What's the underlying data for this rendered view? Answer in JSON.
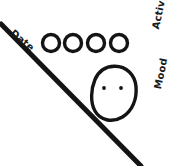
{
  "sketch": {
    "title": "Hand-drawn daily tracker sketch",
    "background_color": "#ffffff",
    "ink_color": "#141414",
    "labels": {
      "date": "Date",
      "activity": "Activity",
      "mood": "Mood"
    },
    "divider": {
      "name": "diagonal-divider-line",
      "from_x": 1,
      "from_y": 24,
      "to_x": 141,
      "to_y": 166,
      "stroke_width": 5
    },
    "activity_circles": {
      "count": 4,
      "diameter": 17,
      "stroke_width": 3.4,
      "filled": false,
      "centers": [
        {
          "cx": 51,
          "cy": 43
        },
        {
          "cx": 73,
          "cy": 43
        },
        {
          "cx": 96,
          "cy": 43
        },
        {
          "cx": 119,
          "cy": 43
        }
      ]
    },
    "mood_face": {
      "name": "blank-face",
      "cx": 114,
      "cy": 93,
      "rx": 22,
      "ry": 27,
      "stroke_width": 3.4,
      "expression": "neutral",
      "mouth": "none",
      "eyes": [
        {
          "cx": 104,
          "cy": 88,
          "r": 1.9
        },
        {
          "cx": 121,
          "cy": 88,
          "r": 1.9
        }
      ]
    }
  }
}
